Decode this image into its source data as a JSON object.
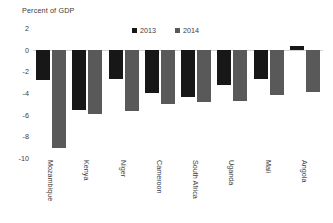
{
  "chart_data": {
    "type": "bar",
    "title": "Percent of GDP",
    "xlabel": "",
    "ylabel": "Percent of GDP",
    "ylim": [
      -10,
      2
    ],
    "yticks": [
      2,
      0,
      -2,
      -4,
      -6,
      -8,
      -10
    ],
    "ytick_labels": [
      "2",
      "0",
      "-2",
      "-4",
      "-6",
      "-8",
      "-10"
    ],
    "grid": false,
    "legend_position": "top-center",
    "categories": [
      "Mozambique",
      "Kenya",
      "Niger",
      "Cameroon",
      "South Africa",
      "Uganda",
      "Mali",
      "Angola"
    ],
    "series": [
      {
        "name": "2013",
        "color": "#171717",
        "values": [
          -2.8,
          -5.6,
          -2.7,
          -4.0,
          -4.4,
          -3.3,
          -2.7,
          0.3
        ]
      },
      {
        "name": "2014",
        "color": "#595959",
        "values": [
          -9.1,
          -5.9,
          -5.7,
          -5.0,
          -4.8,
          -4.7,
          -4.2,
          -3.9
        ]
      }
    ]
  },
  "colors": {
    "series_2013": "#171717",
    "series_2014": "#595959",
    "axis_line": "#d4d4d4",
    "text": "#3b3b3b",
    "background": "#ffffff"
  }
}
